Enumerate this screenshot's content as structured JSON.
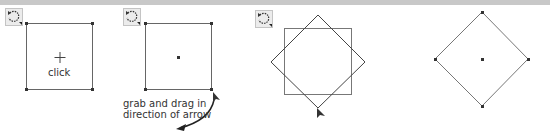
{
  "figure": {
    "panels": [
      {
        "id": 1,
        "label": "click",
        "shape": "square",
        "center": "crosshair"
      },
      {
        "id": 2,
        "label_lines": [
          "grab and drag in",
          "direction of arrow"
        ],
        "shape": "square",
        "center": "dot"
      },
      {
        "id": 3,
        "shape": "square-and-rotated-square",
        "cursor": "arrow-pointer"
      },
      {
        "id": 4,
        "shape": "diamond",
        "center": "dot"
      }
    ],
    "icon": "rotate-tool-icon",
    "colors": {
      "stroke": "#555555",
      "handle": "#333333",
      "icon_bg": "#ececec"
    }
  }
}
